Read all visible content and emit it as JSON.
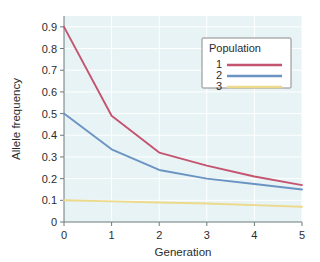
{
  "chart_data": {
    "type": "line",
    "title": "",
    "xlabel": "Generation",
    "ylabel": "Allele frequency",
    "x": [
      0,
      1,
      2,
      3,
      4,
      5
    ],
    "xlim": [
      0,
      5
    ],
    "ylim": [
      0,
      0.95
    ],
    "grid": true,
    "legend": {
      "title": "Population",
      "position": "top-right",
      "entries": [
        {
          "label": "1",
          "color": "#c4546f"
        },
        {
          "label": "2",
          "color": "#6b94c4"
        },
        {
          "label": "3",
          "color": "#ecd98a"
        }
      ]
    },
    "xticks": [
      "0",
      "1",
      "2",
      "3",
      "4",
      "5"
    ],
    "yticks": [
      "0",
      "0.1",
      "0.2",
      "0.3",
      "0.4",
      "0.5",
      "0.6",
      "0.7",
      "0.8",
      "0.9"
    ],
    "ytick_values": [
      0,
      0.1,
      0.2,
      0.3,
      0.4,
      0.5,
      0.6,
      0.7,
      0.8,
      0.9
    ],
    "series": [
      {
        "name": "1",
        "color": "#c4546f",
        "values": [
          0.9,
          0.49,
          0.32,
          0.26,
          0.21,
          0.17
        ]
      },
      {
        "name": "2",
        "color": "#6b94c4",
        "values": [
          0.5,
          0.335,
          0.24,
          0.2,
          0.175,
          0.15
        ]
      },
      {
        "name": "3",
        "color": "#ecd98a",
        "values": [
          0.1,
          0.095,
          0.09,
          0.085,
          0.078,
          0.07
        ]
      }
    ]
  },
  "colors": {
    "plot_background": "#e7f3f4",
    "gridline": "#ffffff",
    "axis": "#6b7b7d",
    "text": "#2c2c2c",
    "legend_background": "#ffffff",
    "legend_border": "#8a8a8a",
    "series_1": "#c4546f",
    "series_2": "#6b94c4",
    "series_3": "#ecd98a"
  },
  "axis": {
    "x_title": "Generation",
    "y_title": "Allele frequency"
  }
}
